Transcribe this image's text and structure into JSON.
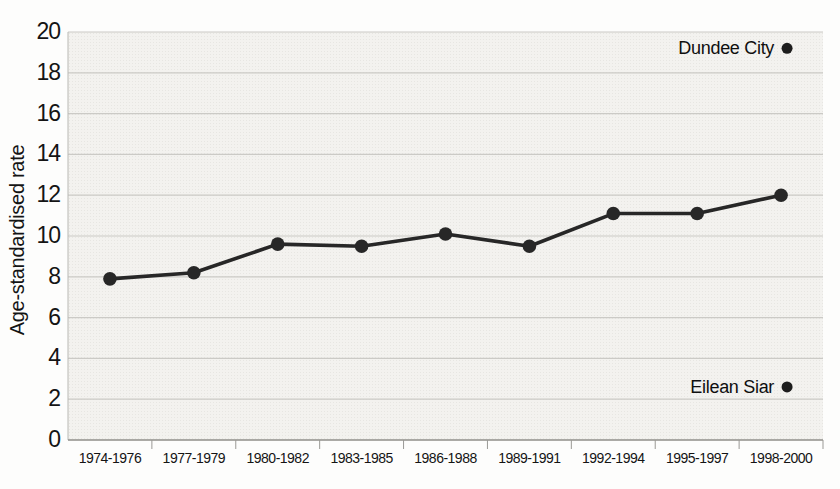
{
  "chart_data": {
    "type": "line",
    "ylabel": "Age-standardised rate",
    "xlabel": "",
    "ylim": [
      0,
      20
    ],
    "ytick_step": 2,
    "yticks": [
      0,
      2,
      4,
      6,
      8,
      10,
      12,
      14,
      16,
      18,
      20
    ],
    "categories": [
      "1974-1976",
      "1977-1979",
      "1980-1982",
      "1983-1985",
      "1986-1988",
      "1989-1991",
      "1992-1994",
      "1995-1997",
      "1998-2000"
    ],
    "series": [
      {
        "name": "Age-standardised rate",
        "values": [
          7.9,
          8.2,
          9.6,
          9.5,
          10.1,
          9.5,
          11.1,
          11.1,
          12.0
        ]
      }
    ],
    "annotations": [
      {
        "label": "Dundee City",
        "value": 19.2,
        "category_index": 8
      },
      {
        "label": "Eilean Siar",
        "value": 2.6,
        "category_index": 8
      }
    ],
    "grid": true,
    "legend_position": "none"
  },
  "style": {
    "line_color": "#272727",
    "marker_color": "#272727",
    "annotation_dot_color": "#1d1d1d",
    "grid_color": "#cbcac6",
    "y_axis_line_color": "#b9b8b4",
    "x_axis_line_color": "#8f8e8a",
    "tick_color": "#9a9995",
    "plot_bg": "#f3f2ef",
    "text_color": "#141414"
  }
}
